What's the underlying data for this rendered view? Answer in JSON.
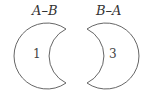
{
  "diagram": {
    "type": "set-difference",
    "left": {
      "title": "A–B",
      "region_value": "1"
    },
    "right": {
      "title": "B–A",
      "region_value": "3"
    },
    "stroke_color": "#666666",
    "fill_color": "#ffffff"
  }
}
